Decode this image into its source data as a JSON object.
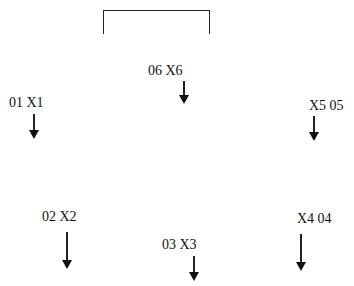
{
  "diagram": {
    "bracket": {
      "x": 103,
      "y": 10,
      "width": 107,
      "height": 24
    },
    "nodes": [
      {
        "id": "01",
        "label": "01  X1",
        "text_x": 9,
        "text_y": 96,
        "arrow_x": 29,
        "arrow_y": 114,
        "arrow_len": 25
      },
      {
        "id": "02",
        "label": "02 X2",
        "text_x": 42,
        "text_y": 210,
        "arrow_x": 62,
        "arrow_y": 232,
        "arrow_len": 37
      },
      {
        "id": "03",
        "label": "03 X3",
        "text_x": 162,
        "text_y": 238,
        "arrow_x": 189,
        "arrow_y": 256,
        "arrow_len": 25
      },
      {
        "id": "04",
        "label": "X4 04",
        "text_x": 297,
        "text_y": 212,
        "arrow_x": 296,
        "arrow_y": 234,
        "arrow_len": 37
      },
      {
        "id": "05",
        "label": "X5 05",
        "text_x": 309,
        "text_y": 99,
        "arrow_x": 309,
        "arrow_y": 116,
        "arrow_len": 25
      },
      {
        "id": "06",
        "label": "06 X6",
        "text_x": 148,
        "text_y": 64,
        "arrow_x": 179,
        "arrow_y": 81,
        "arrow_len": 23
      }
    ]
  }
}
